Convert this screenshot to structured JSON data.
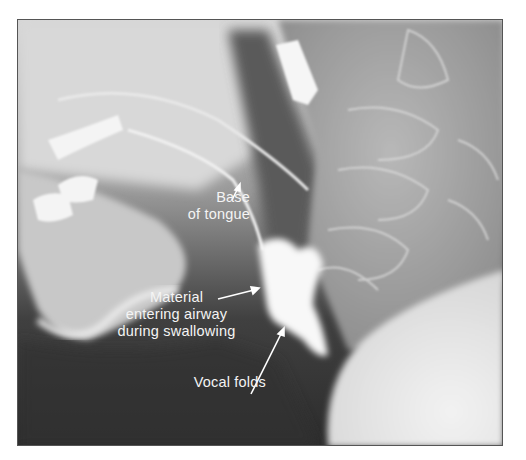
{
  "figure": {
    "marker_text": "OCHA",
    "labels": {
      "base_of_tongue": [
        "Base",
        "of tongue"
      ],
      "material_entering_airway": [
        "Material",
        "entering airway",
        "during swallowing"
      ],
      "vocal_folds": "Vocal folds"
    },
    "colors": {
      "border": "#555555",
      "label_text": "#f4f4f4",
      "dark_region": "#2e2e2e",
      "bright_region": "#ececec"
    }
  }
}
